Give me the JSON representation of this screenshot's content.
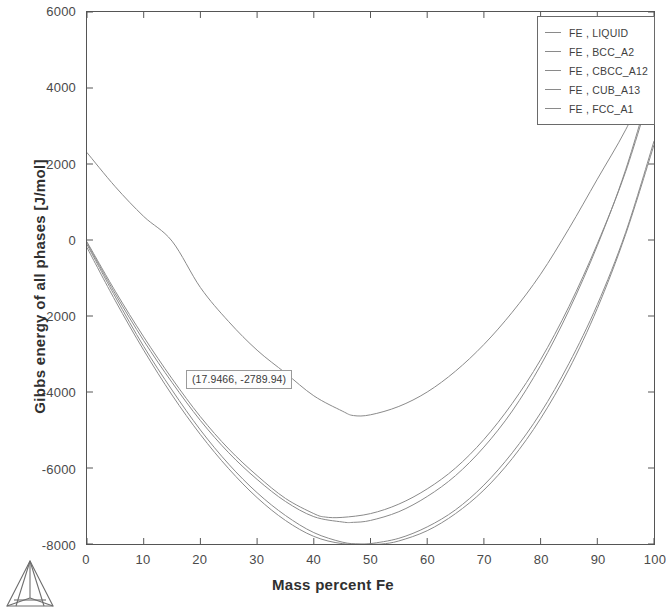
{
  "chart_data": {
    "type": "line",
    "title": "",
    "xlabel": "Mass percent Fe",
    "ylabel": "Gibbs energy of all phases [J/mol]",
    "xlim": [
      0,
      100
    ],
    "ylim": [
      -8000,
      6000
    ],
    "xticks": [
      0,
      10,
      20,
      30,
      40,
      50,
      60,
      70,
      80,
      90,
      100
    ],
    "yticks": [
      6000,
      4000,
      2000,
      0,
      -2000,
      -4000,
      -6000,
      -8000
    ],
    "grid": false,
    "legend_position": "top-right",
    "line_color": "#8a8a8a",
    "annotations": [
      {
        "label": "(17.9466, -2789.94)",
        "x": 17.9466,
        "y": -2789.94
      }
    ],
    "series": [
      {
        "name": "FE , LIQUID",
        "x": [
          0,
          5,
          10,
          15,
          20,
          25,
          30,
          35,
          40,
          45,
          47,
          50,
          55,
          60,
          65,
          70,
          75,
          80,
          85,
          90,
          95,
          100
        ],
        "values": [
          2300,
          1400,
          620,
          -30,
          -1250,
          -2150,
          -2900,
          -3500,
          -4100,
          -4500,
          -4620,
          -4600,
          -4380,
          -4000,
          -3450,
          -2750,
          -1900,
          -900,
          300,
          1600,
          2900,
          4450
        ]
      },
      {
        "name": "FE , BCC_A2",
        "x": [
          0,
          5,
          10,
          15,
          20,
          25,
          30,
          35,
          40,
          42,
          45,
          50,
          55,
          60,
          65,
          70,
          75,
          80,
          85,
          90,
          95,
          100
        ],
        "values": [
          -50,
          -1350,
          -2550,
          -3650,
          -4650,
          -5500,
          -6200,
          -6800,
          -7200,
          -7290,
          -7300,
          -7200,
          -6950,
          -6550,
          -6000,
          -5250,
          -4300,
          -3150,
          -1750,
          -100,
          1800,
          4200
        ]
      },
      {
        "name": "FE , CBCC_A12",
        "x": [
          0,
          5,
          10,
          15,
          20,
          25,
          30,
          35,
          40,
          45,
          48,
          50,
          55,
          60,
          65,
          70,
          75,
          80,
          85,
          90,
          95,
          100
        ],
        "values": [
          -120,
          -1500,
          -2800,
          -3950,
          -5000,
          -5900,
          -6650,
          -7250,
          -7700,
          -7950,
          -8000,
          -7990,
          -7850,
          -7550,
          -7100,
          -6450,
          -5600,
          -4550,
          -3250,
          -1700,
          200,
          2600
        ]
      },
      {
        "name": "FE , CUB_A13",
        "x": [
          0,
          5,
          10,
          15,
          20,
          25,
          30,
          35,
          40,
          45,
          50,
          52,
          55,
          60,
          65,
          70,
          75,
          80,
          85,
          90,
          95,
          100
        ],
        "values": [
          -200,
          -1600,
          -2900,
          -4080,
          -5120,
          -6020,
          -6780,
          -7380,
          -7800,
          -7990,
          -8010,
          -8000,
          -7920,
          -7650,
          -7200,
          -6580,
          -5750,
          -4700,
          -3400,
          -1800,
          150,
          2500
        ]
      },
      {
        "name": "FE , FCC_A1",
        "x": [
          0,
          5,
          10,
          15,
          20,
          25,
          30,
          35,
          40,
          45,
          47,
          50,
          55,
          60,
          65,
          70,
          75,
          80,
          85,
          90,
          95,
          100
        ],
        "values": [
          -80,
          -1420,
          -2650,
          -3750,
          -4750,
          -5600,
          -6300,
          -6880,
          -7280,
          -7420,
          -7430,
          -7380,
          -7150,
          -6750,
          -6200,
          -5450,
          -4500,
          -3300,
          -1850,
          -150,
          1850,
          4350
        ]
      }
    ]
  },
  "axes": {
    "x_tick_labels": [
      "0",
      "10",
      "20",
      "30",
      "40",
      "50",
      "60",
      "70",
      "80",
      "90",
      "100"
    ],
    "y_tick_labels": [
      "6000",
      "4000",
      "2000",
      "0",
      "-2000",
      "-4000",
      "-6000",
      "-8000"
    ],
    "x_title": "Mass percent Fe",
    "y_title": "Gibbs energy of all phases [J/mol]"
  },
  "legend": {
    "items": [
      {
        "label": "FE , LIQUID"
      },
      {
        "label": "FE , BCC_A2"
      },
      {
        "label": "FE , CBCC_A12"
      },
      {
        "label": "FE , CUB_A13"
      },
      {
        "label": "FE , FCC_A1"
      }
    ]
  },
  "annotation": {
    "text": "(17.9466, -2789.94)"
  },
  "logo": {
    "name": "tetrahedron-logo"
  }
}
